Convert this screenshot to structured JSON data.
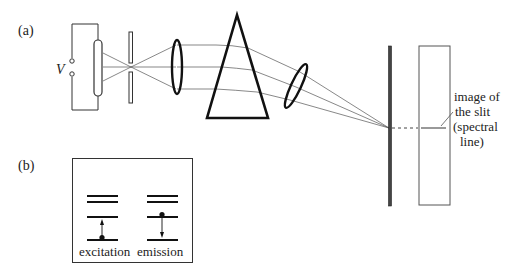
{
  "figure": {
    "panel_a": {
      "label": "(a)",
      "voltage_label": "V",
      "annotation_lines": [
        "image of",
        "the slit",
        "(spectral",
        "line)"
      ]
    },
    "panel_b": {
      "label": "(b)",
      "excitation_label": "excitation",
      "emission_label": "emission"
    }
  }
}
